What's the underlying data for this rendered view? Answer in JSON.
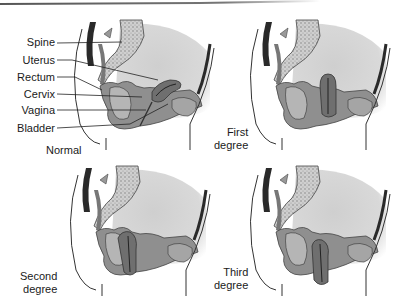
{
  "figure": {
    "anatomy_labels": [
      "Spine",
      "Uterus",
      "Rectum",
      "Cervix",
      "Vagina",
      "Bladder"
    ],
    "panels": [
      {
        "id": "normal",
        "caption": "Normal"
      },
      {
        "id": "first",
        "caption_line1": "First",
        "caption_line2": "degree"
      },
      {
        "id": "second",
        "caption_line1": "Second",
        "caption_line2": "degree"
      },
      {
        "id": "third",
        "caption_line1": "Third",
        "caption_line2": "degree"
      }
    ],
    "colors": {
      "abdomen_shade": "#d2d2d2",
      "tissue": "#8a8a8a",
      "dark_muscle": "#2a2a2a",
      "outline": "#333333",
      "bone": "#bdbdbd"
    }
  }
}
